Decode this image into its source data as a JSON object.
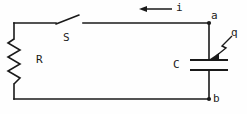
{
  "figure": {
    "background_color": "#fefefe",
    "line_color": "#1a1a1a",
    "width": 247,
    "height": 114
  },
  "labels": {
    "resistor": "R",
    "switch": "S",
    "capacitor": "C",
    "charge": "q",
    "current": "i",
    "node_top": "a",
    "node_bottom": "b"
  },
  "components": [
    {
      "name": "resistor",
      "symbol": "zigzag",
      "label": "R",
      "orientation": "vertical",
      "position": "left-branch"
    },
    {
      "name": "switch",
      "symbol": "open-switch",
      "label": "S",
      "state": "open",
      "orientation": "horizontal",
      "position": "top-branch"
    },
    {
      "name": "capacitor",
      "symbol": "parallel-plates",
      "label": "C",
      "orientation": "horizontal-plates",
      "position": "right-branch"
    }
  ],
  "annotations": [
    {
      "name": "current-arrow",
      "label": "i",
      "direction": "left",
      "description": "current arrow on top wire pointing left"
    },
    {
      "name": "charge-pointer",
      "label": "q",
      "direction": "down-left",
      "description": "zigzag pointer from q label to upper capacitor plate"
    }
  ],
  "nodes": [
    {
      "name": "node-a",
      "label": "a",
      "position": "top-right"
    },
    {
      "name": "node-b",
      "label": "b",
      "position": "bottom-right"
    }
  ]
}
